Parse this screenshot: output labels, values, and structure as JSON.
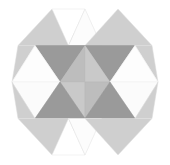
{
  "figure": {
    "type": "geometric-pattern",
    "width": 170,
    "height": 165,
    "background": "#ffffff",
    "symmetry": "4-fold mirror (horizontal + vertical)",
    "center": {
      "x": 85,
      "y": 82
    }
  },
  "palette": {
    "white": "#ffffff",
    "near_white": "#fafafa",
    "very_light": "#f2f2f2",
    "light_gray": "#d8d8d8",
    "mid_light_gray": "#cfcfcf",
    "mid_gray": "#bdbdbd",
    "dark_gray": "#9a9a9a",
    "darkest_gray": "#8a8a8a",
    "edge": "#e4e4e4",
    "edge_soft": "#ededed"
  },
  "grid": {
    "columns_x": [
      12,
      36.25,
      60.5,
      85,
      109.5,
      133.75,
      158
    ],
    "rows_y": [
      9,
      45.5,
      82,
      118.5,
      155
    ],
    "peaks_top": [
      52,
      85,
      118
    ],
    "peaks_bottom": [
      52,
      85,
      118
    ],
    "left_point": {
      "x": 12,
      "y": 82
    },
    "right_point": {
      "x": 158,
      "y": 82
    }
  },
  "triangles": [
    {
      "id": "t01",
      "name": "top-left-outer-up",
      "points": "18,45.5 52,9 85,45.5",
      "fill": "#cfcfcf",
      "stroke": "#e0e0e0"
    },
    {
      "id": "t02",
      "name": "top-center-up-white",
      "points": "52,9 85,9 68.5,45.5",
      "fill": "#ffffff",
      "stroke": "#e4e4e4"
    },
    {
      "id": "t03",
      "name": "top-center-peak-white",
      "points": "68.5,45.5 85,9 101.5,45.5",
      "fill": "#fcfcfc",
      "stroke": "#e0e0e0"
    },
    {
      "id": "t04",
      "name": "top-right-outer-up",
      "points": "85,45.5 118,9 152,45.5",
      "fill": "#cfcfcf",
      "stroke": "#e0e0e0"
    },
    {
      "id": "t05",
      "name": "upper-left-dark-down",
      "points": "35,45.5 85,45.5 60,82",
      "fill": "#9a9a9a",
      "stroke": "#8f8f8f"
    },
    {
      "id": "t06",
      "name": "upper-right-dark-down",
      "points": "85,45.5 135,45.5 110,82",
      "fill": "#9a9a9a",
      "stroke": "#8f8f8f"
    },
    {
      "id": "t07",
      "name": "upper-left-wedge-light",
      "points": "18,45.5 35,45.5 12,82",
      "fill": "#cfcfcf",
      "stroke": "#dcdcdc"
    },
    {
      "id": "t08",
      "name": "upper-right-wedge-light",
      "points": "135,45.5 152,45.5 158,82",
      "fill": "#cfcfcf",
      "stroke": "#dcdcdc"
    },
    {
      "id": "t09",
      "name": "upper-left-inner-white",
      "points": "35,45.5 60,82 12,82",
      "fill": "#fbfbfb",
      "stroke": "#e4e4e4"
    },
    {
      "id": "t10",
      "name": "upper-right-inner-white",
      "points": "135,45.5 158,82 110,82",
      "fill": "#fbfbfb",
      "stroke": "#e4e4e4"
    },
    {
      "id": "t11",
      "name": "center-top-left-up",
      "points": "60,82 85,45.5 85,82",
      "fill": "#bdbdbd",
      "stroke": "#b4b4b4"
    },
    {
      "id": "t12",
      "name": "center-top-right-up",
      "points": "85,45.5 110,82 85,82",
      "fill": "#c9c9c9",
      "stroke": "#bfbfbf"
    },
    {
      "id": "t13",
      "name": "mid-left-white-band-upper",
      "points": "12,82 60,82 35,45.5",
      "fill": "#fdfdfd",
      "stroke": "#ececec"
    },
    {
      "id": "t14",
      "name": "mid-right-white-band-upper",
      "points": "110,82 158,82 135,45.5",
      "fill": "#fdfdfd",
      "stroke": "#ececec"
    },
    {
      "id": "t15",
      "name": "mid-left-white-band-lower",
      "points": "12,82 60,82 35,118.5",
      "fill": "#fbfbfb",
      "stroke": "#ececec"
    },
    {
      "id": "t16",
      "name": "mid-right-white-band-lower",
      "points": "110,82 158,82 135,118.5",
      "fill": "#fbfbfb",
      "stroke": "#ececec"
    },
    {
      "id": "t17",
      "name": "center-bot-left-down",
      "points": "60,82 85,82 85,118.5",
      "fill": "#c9c9c9",
      "stroke": "#bfbfbf"
    },
    {
      "id": "t18",
      "name": "center-bot-right-down",
      "points": "85,82 110,82 85,118.5",
      "fill": "#bdbdbd",
      "stroke": "#b4b4b4"
    },
    {
      "id": "t19",
      "name": "lower-left-dark-up",
      "points": "35,118.5 85,118.5 60,82",
      "fill": "#9a9a9a",
      "stroke": "#8f8f8f"
    },
    {
      "id": "t20",
      "name": "lower-right-dark-up",
      "points": "85,118.5 135,118.5 110,82",
      "fill": "#9a9a9a",
      "stroke": "#8f8f8f"
    },
    {
      "id": "t21",
      "name": "lower-left-wedge-light",
      "points": "18,118.5 35,118.5 12,82",
      "fill": "#cfcfcf",
      "stroke": "#dcdcdc"
    },
    {
      "id": "t22",
      "name": "lower-right-wedge-light",
      "points": "135,118.5 152,118.5 158,82",
      "fill": "#cfcfcf",
      "stroke": "#dcdcdc"
    },
    {
      "id": "t23",
      "name": "bottom-left-outer-down",
      "points": "18,118.5 52,155 85,118.5",
      "fill": "#cfcfcf",
      "stroke": "#e0e0e0"
    },
    {
      "id": "t24",
      "name": "bottom-center-down-white",
      "points": "52,155 85,155 68.5,118.5",
      "fill": "#ffffff",
      "stroke": "#e4e4e4"
    },
    {
      "id": "t25",
      "name": "bottom-center-valley-white",
      "points": "68.5,118.5 85,155 101.5,118.5",
      "fill": "#fcfcfc",
      "stroke": "#e0e0e0"
    },
    {
      "id": "t26",
      "name": "bottom-right-outer-down",
      "points": "85,118.5 118,155 152,118.5",
      "fill": "#cfcfcf",
      "stroke": "#e0e0e0"
    }
  ]
}
